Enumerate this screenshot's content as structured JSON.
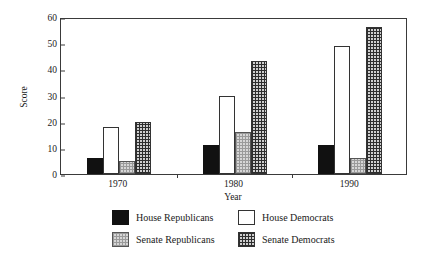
{
  "chart_data": {
    "type": "bar",
    "title": "",
    "xlabel": "Year",
    "ylabel": "Score",
    "categories": [
      "1970",
      "1980",
      "1990"
    ],
    "ylim": [
      0,
      60
    ],
    "yticks": [
      0,
      10,
      20,
      30,
      40,
      50,
      60
    ],
    "grid": false,
    "legend_position": "bottom",
    "series": [
      {
        "name": "House Republicans",
        "pattern": "solid-black",
        "values": [
          6,
          11,
          11
        ]
      },
      {
        "name": "House Democrats",
        "pattern": "open-white",
        "values": [
          18,
          30,
          49
        ]
      },
      {
        "name": "Senate Republicans",
        "pattern": "light-dotted",
        "values": [
          5,
          16,
          6
        ]
      },
      {
        "name": "Senate Democrats",
        "pattern": "dark-crosshatch",
        "values": [
          20,
          43,
          56
        ]
      }
    ]
  },
  "axes": {
    "y_label": "Score",
    "x_label": "Year",
    "y_ticks": [
      "0",
      "10",
      "20",
      "30",
      "40",
      "50",
      "60"
    ],
    "x_ticks": [
      "1970",
      "1980",
      "1990"
    ]
  },
  "legend": {
    "items": [
      {
        "label": "House Republicans"
      },
      {
        "label": "House Democrats"
      },
      {
        "label": "Senate Republicans"
      },
      {
        "label": "Senate Democrats"
      }
    ]
  },
  "colors": {
    "axis": "#3a3a3a",
    "text": "#1a1a1a",
    "series_solid": "#111111",
    "series_open": "#ffffff",
    "series_light": "#d6d6d6",
    "series_dark": "#cfcfcf",
    "background": "#ffffff"
  }
}
